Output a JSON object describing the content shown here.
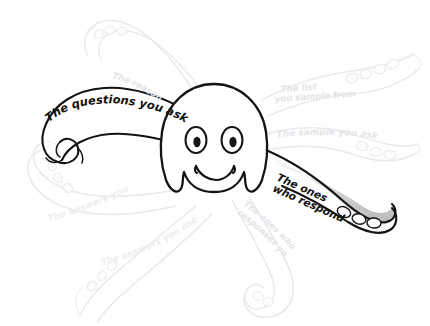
{
  "figure": {
    "background_color": "#ffffff",
    "ink_color": "#141414",
    "ghost_ink_color": "#e9e9ec",
    "highlight_fill": "#c9c9c9"
  },
  "labels": {
    "questions_you_ask": "The questions you ask",
    "ones_who_respond_line1": "The ones",
    "ones_who_respond_line2": "who respond",
    "reason_youre_doing_it": "The reason you're doing it",
    "list_you_sample_from_line1": "The list",
    "list_you_sample_from_line2": "you sample from",
    "sample_you_ask": "The sample you ask",
    "answers_you_get": "The answers you get",
    "answers_you_use": "The answers you use",
    "ones_whose_responses_line1": "The ones whose",
    "ones_whose_responses_line2": "responses you use"
  },
  "tentacles": [
    {
      "name": "questions-you-ask",
      "emphasis": "dark",
      "position": "left-upper"
    },
    {
      "name": "ones-who-respond",
      "emphasis": "dark",
      "position": "right-lower"
    },
    {
      "name": "reason-youre-doing-it",
      "emphasis": "ghost",
      "position": "top-left"
    },
    {
      "name": "list-you-sample-from",
      "emphasis": "ghost",
      "position": "top-right"
    },
    {
      "name": "sample-you-ask",
      "emphasis": "ghost",
      "position": "right-upper"
    },
    {
      "name": "answers-you-get",
      "emphasis": "ghost",
      "position": "left-lower"
    },
    {
      "name": "answers-you-use",
      "emphasis": "ghost",
      "position": "bottom-left"
    },
    {
      "name": "ones-whose-responses-you-use",
      "emphasis": "ghost",
      "position": "bottom-right"
    }
  ],
  "face": {
    "eyes": 2,
    "expression": "smile"
  }
}
